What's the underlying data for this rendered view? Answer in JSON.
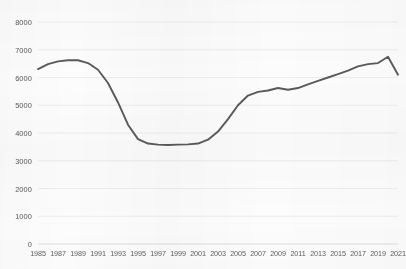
{
  "chart_data": {
    "type": "line",
    "title": "",
    "xlabel": "",
    "ylabel": "",
    "grid": true,
    "legend": "none",
    "line_color": "#5a5a5a",
    "grid_color": "#e9e9e9",
    "axis_color": "#d8d8d8",
    "background_color": "#fcfcfc",
    "xlim": [
      1985,
      2021
    ],
    "ylim": [
      0,
      8000
    ],
    "y_ticks": [
      0,
      1000,
      2000,
      3000,
      4000,
      5000,
      6000,
      7000,
      8000
    ],
    "y_tick_labels": [
      "0",
      "1000",
      "2000",
      "3000",
      "4000",
      "5000",
      "6000",
      "7000",
      "8000"
    ],
    "x_ticks": [
      1985,
      1987,
      1989,
      1991,
      1993,
      1995,
      1997,
      1999,
      2001,
      2003,
      2005,
      2007,
      2009,
      2011,
      2013,
      2015,
      2017,
      2019,
      2021
    ],
    "x_tick_labels": [
      "1985",
      "1987",
      "1989",
      "1991",
      "1993",
      "1995",
      "1997",
      "1999",
      "2001",
      "2003",
      "2005",
      "2007",
      "2009",
      "2011",
      "2013",
      "2015",
      "2017",
      "2019",
      "2021"
    ],
    "x": [
      1985,
      1986,
      1987,
      1988,
      1989,
      1990,
      1991,
      1992,
      1993,
      1994,
      1995,
      1996,
      1997,
      1998,
      1999,
      2000,
      2001,
      2002,
      2003,
      2004,
      2005,
      2006,
      2007,
      2008,
      2009,
      2010,
      2011,
      2012,
      2013,
      2014,
      2015,
      2016,
      2017,
      2018,
      2019,
      2020,
      2021
    ],
    "values": [
      6300,
      6480,
      6580,
      6620,
      6620,
      6520,
      6280,
      5800,
      5100,
      4300,
      3780,
      3620,
      3580,
      3570,
      3580,
      3590,
      3620,
      3760,
      4050,
      4500,
      5000,
      5350,
      5480,
      5530,
      5620,
      5560,
      5620,
      5750,
      5880,
      6000,
      6120,
      6250,
      6400,
      6480,
      6520,
      6750,
      6100
    ]
  }
}
